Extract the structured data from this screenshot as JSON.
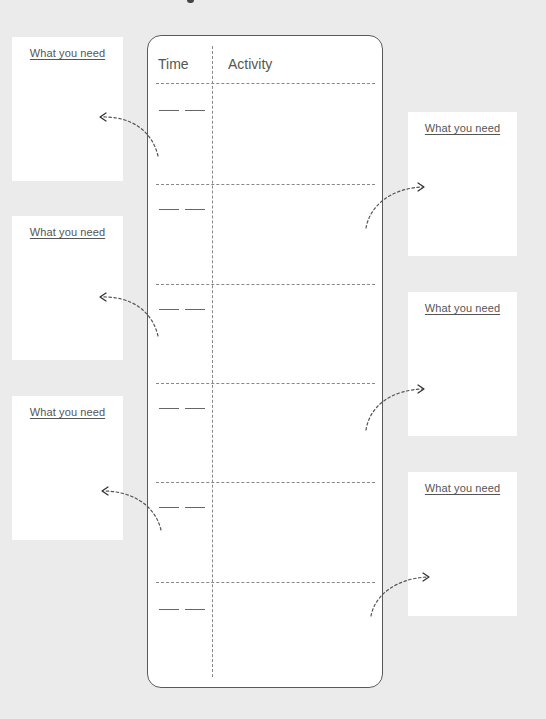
{
  "schedule": {
    "headers": {
      "time": "Time",
      "activity": "Activity"
    },
    "slots": [
      {
        "time_hour": "",
        "time_minute": "",
        "activity": ""
      },
      {
        "time_hour": "",
        "time_minute": "",
        "activity": ""
      },
      {
        "time_hour": "",
        "time_minute": "",
        "activity": ""
      },
      {
        "time_hour": "",
        "time_minute": "",
        "activity": ""
      },
      {
        "time_hour": "",
        "time_minute": "",
        "activity": ""
      },
      {
        "time_hour": "",
        "time_minute": "",
        "activity": ""
      }
    ]
  },
  "need_panels": {
    "left": [
      {
        "label": "What you need"
      },
      {
        "label": "What you need"
      },
      {
        "label": "What you need"
      }
    ],
    "right": [
      {
        "label": "What you need"
      },
      {
        "label": "What you need"
      },
      {
        "label": "What you need"
      }
    ]
  },
  "icons": {
    "connector": "dotted-curved-arrow-icon"
  },
  "colors": {
    "background": "#ebebeb",
    "panel": "#ffffff",
    "text": "#555555",
    "border": "#5a5a5a",
    "dashed_line": "#888888"
  }
}
